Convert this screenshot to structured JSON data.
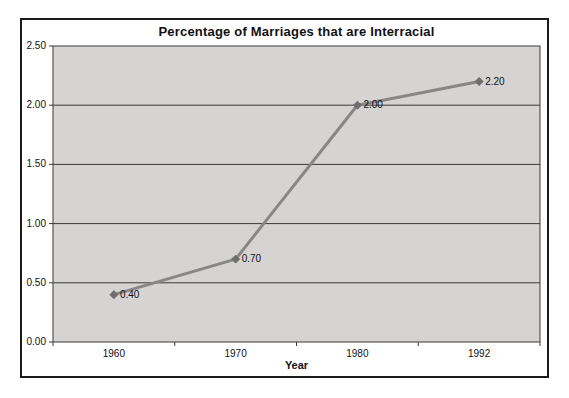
{
  "chart": {
    "title": "Percentage of Marriages that are Interracial",
    "x_axis_title": "Year"
  },
  "chart_data": {
    "type": "line",
    "title": "Percentage of Marriages that are Interracial",
    "xlabel": "Year",
    "ylabel": "",
    "categories": [
      "1960",
      "1970",
      "1980",
      "1992"
    ],
    "values": [
      0.4,
      0.7,
      2.0,
      2.2
    ],
    "data_labels": [
      "0.40",
      "0.70",
      "2.00",
      "2.20"
    ],
    "ylim": [
      0,
      2.5
    ],
    "ytick_labels": [
      "0.00",
      "0.50",
      "1.00",
      "1.50",
      "2.00",
      "2.50"
    ],
    "grid": "horizontal",
    "legend": "none",
    "marker": "diamond",
    "colors": {
      "line": "#878787",
      "marker": "#6e6e6e",
      "plot_background": "#d5d4d2",
      "gridline": "#3a3a3a",
      "frame_border": "#1b1b1b",
      "text": "#111111"
    }
  }
}
